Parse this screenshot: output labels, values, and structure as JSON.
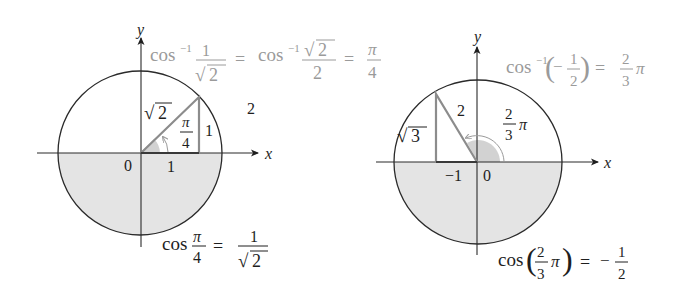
{
  "figure": {
    "left": {
      "axes": {
        "x_label": "x",
        "y_label": "y",
        "origin_label": "0",
        "tick_label": "1"
      },
      "triangle": {
        "hypotenuse_label_radical": "√",
        "hypotenuse_label_value": "2",
        "opposite_label": "1",
        "angle_num": "π",
        "angle_den": "4"
      },
      "radius_label": "2",
      "top_equation": {
        "cos": "cos",
        "inv": "−1",
        "frac1_num": "1",
        "frac1_den_radical": "√",
        "frac1_den_value": "2",
        "equals1": "=",
        "frac2_num_radical": "√",
        "frac2_num_value": "2",
        "frac2_den": "2",
        "equals2": "=",
        "frac3_num": "π",
        "frac3_den": "4"
      },
      "bottom_equation": {
        "cos": "cos",
        "frac1_num": "π",
        "frac1_den": "4",
        "equals": "=",
        "frac2_num": "1",
        "frac2_den_radical": "√",
        "frac2_den_value": "2"
      }
    },
    "right": {
      "axes": {
        "x_label": "x",
        "y_label": "y",
        "origin_label": "0",
        "tick_label": "−1"
      },
      "triangle": {
        "hypotenuse_label": "2",
        "side_label_radical": "√",
        "side_label_value": "3",
        "angle_num": "2",
        "angle_den": "3",
        "angle_suffix": "π"
      },
      "top_equation": {
        "cos": "cos",
        "inv": "−1",
        "lparen": "(",
        "minus": "−",
        "frac_num": "1",
        "frac_den": "2",
        "rparen": ")",
        "equals": "=",
        "res_num": "2",
        "res_den": "3",
        "res_suffix": "π"
      },
      "bottom_equation": {
        "cos": "cos",
        "lparen": "(",
        "frac_num": "2",
        "frac_den": "3",
        "frac_suffix": "π",
        "rparen": ")",
        "equals": "=",
        "minus": "−",
        "res_num": "1",
        "res_den": "2"
      }
    },
    "colors": {
      "line": "#2a2a2a",
      "triangle": "#8c8c8c",
      "shade": "#e4e4e4",
      "grey_text": "#9a9a9a"
    }
  }
}
